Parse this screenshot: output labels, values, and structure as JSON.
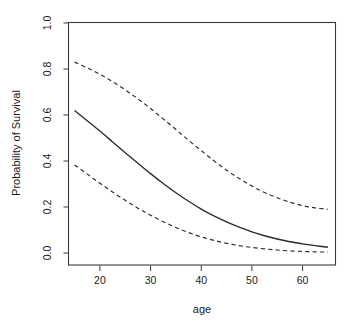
{
  "chart_data": {
    "type": "line",
    "title": "",
    "xlabel": "age",
    "ylabel": "Probability of Survival",
    "xlim": [
      13.9,
      66.5
    ],
    "ylim": [
      0.0,
      1.0
    ],
    "grid": false,
    "legend": null,
    "legend_position": "none",
    "x_ticks": [
      20,
      30,
      40,
      50,
      60
    ],
    "x_tick_labels": [
      "20",
      "30",
      "40",
      "50",
      "60"
    ],
    "y_ticks": [
      0.0,
      0.2,
      0.4,
      0.6,
      0.8,
      1.0
    ],
    "y_tick_labels": [
      "0.0",
      "0.2",
      "0.4",
      "0.6",
      "0.8",
      "1.0"
    ],
    "x": [
      15,
      17.5,
      20,
      22.5,
      25,
      27.5,
      30,
      32.5,
      35,
      37.5,
      40,
      42.5,
      45,
      47.5,
      50,
      52.5,
      55,
      57.5,
      60,
      62.5,
      65
    ],
    "series": [
      {
        "name": "Fitted probability",
        "style": "solid",
        "values": [
          0.62,
          0.575,
          0.53,
          0.483,
          0.436,
          0.39,
          0.345,
          0.302,
          0.262,
          0.225,
          0.191,
          0.161,
          0.135,
          0.112,
          0.092,
          0.075,
          0.061,
          0.049,
          0.04,
          0.032,
          0.025
        ]
      },
      {
        "name": "Upper 95% confidence limit",
        "style": "dashed",
        "values": [
          0.83,
          0.805,
          0.777,
          0.745,
          0.709,
          0.67,
          0.628,
          0.583,
          0.537,
          0.49,
          0.445,
          0.401,
          0.36,
          0.324,
          0.291,
          0.263,
          0.24,
          0.221,
          0.206,
          0.196,
          0.19
        ]
      },
      {
        "name": "Lower 95% confidence limit",
        "style": "dashed",
        "values": [
          0.383,
          0.343,
          0.303,
          0.265,
          0.229,
          0.195,
          0.164,
          0.136,
          0.111,
          0.089,
          0.07,
          0.055,
          0.042,
          0.032,
          0.024,
          0.018,
          0.013,
          0.009,
          0.007,
          0.005,
          0.004
        ]
      }
    ]
  },
  "axes": {
    "x_title": "age",
    "y_title": "Probability of Survival"
  },
  "colors": {
    "line": "#2b2b2b",
    "axis": "#3a3a3a",
    "background": "#ffffff",
    "text": "#1a1a1a"
  }
}
